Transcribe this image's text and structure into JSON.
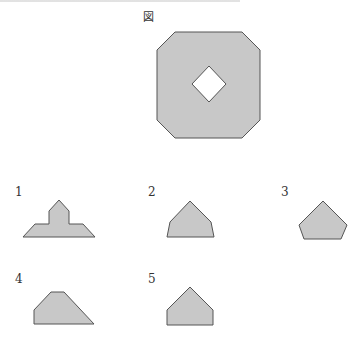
{
  "figure": {
    "label": "図",
    "fill_color": "#c8c8c8",
    "stroke_color": "#555555"
  },
  "options": [
    {
      "number": "1",
      "shape": "cross-topped trapezoid"
    },
    {
      "number": "2",
      "shape": "pentagon (house, splayed)"
    },
    {
      "number": "3",
      "shape": "pentagon"
    },
    {
      "number": "4",
      "shape": "right trapezoid"
    },
    {
      "number": "5",
      "shape": "pentagon (house)"
    }
  ]
}
